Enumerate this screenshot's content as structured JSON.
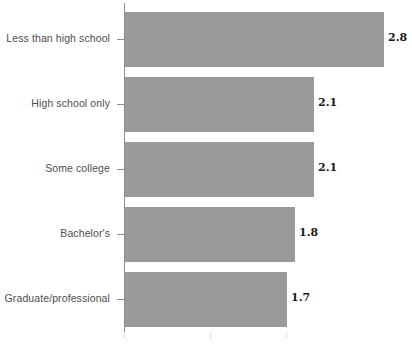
{
  "chart_data": {
    "type": "bar",
    "orientation": "horizontal",
    "title": "",
    "subtitle": "",
    "xlabel": "",
    "ylabel": "",
    "categories": [
      "Less than high school",
      "High school only",
      "Some college",
      "Bachelor's",
      "Graduate/professional"
    ],
    "values": [
      2.8,
      2.1,
      2.1,
      1.8,
      1.7
    ],
    "value_labels": [
      "2.8",
      "2.1",
      "2.1",
      "1.8",
      "1.7"
    ],
    "series": [
      {
        "name": "",
        "values": [
          2.8,
          2.1,
          2.1,
          1.8,
          1.7
        ]
      }
    ],
    "xlim": [
      0,
      3.15
    ],
    "ylim": [
      0,
      5
    ],
    "xticks": [],
    "xticklabels": [],
    "grid": false,
    "legend": false,
    "legend_position": "none",
    "bar_color": "#9a9a9a",
    "axis_color": "#8c8c8c",
    "label_color": "#4d4d4d",
    "value_label_color": "#1a1a1a",
    "background_color": "#ffffff",
    "annotations": []
  },
  "bars": [
    {
      "category": "Less than high school",
      "value": 2.8,
      "label": "2.8",
      "bar_px": 259,
      "row_top": 12,
      "value_left": 388
    },
    {
      "category": "High school only",
      "value": 2.1,
      "label": "2.1",
      "bar_px": 189,
      "row_top": 77,
      "value_left": 318
    },
    {
      "category": "Some college",
      "value": 2.1,
      "label": "2.1",
      "bar_px": 189,
      "row_top": 142,
      "value_left": 318
    },
    {
      "category": "Bachelor's",
      "value": 1.8,
      "label": "1.8",
      "bar_px": 170,
      "row_top": 207,
      "value_left": 299
    },
    {
      "category": "Graduate/professional",
      "value": 1.7,
      "label": "1.7",
      "bar_px": 162,
      "row_top": 272,
      "value_left": 291
    }
  ],
  "x_ticks_px": [
    124,
    210,
    286
  ]
}
